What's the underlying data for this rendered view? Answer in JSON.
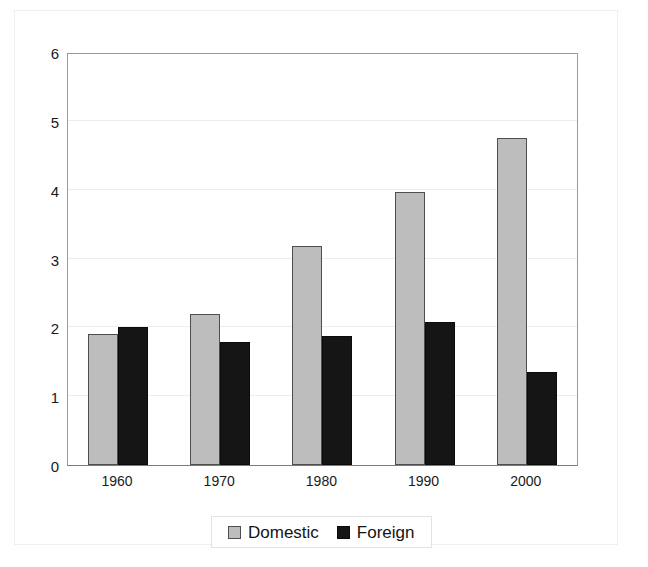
{
  "chart_data": {
    "type": "bar",
    "title": "",
    "subtitle": "",
    "xlabel": "",
    "ylabel": "",
    "categories": [
      "1960",
      "1970",
      "1980",
      "1990",
      "2000"
    ],
    "series": [
      {
        "name": "Domestic",
        "color": "#bdbdbd",
        "values": [
          1.9,
          2.2,
          3.18,
          3.97,
          4.75
        ]
      },
      {
        "name": "Foreign",
        "color": "#151515",
        "values": [
          2.0,
          1.78,
          1.88,
          2.08,
          1.35
        ]
      }
    ],
    "ylim": [
      0,
      6
    ],
    "yticks": [
      0,
      1,
      2,
      3,
      4,
      5,
      6
    ],
    "ytick_labels": [
      "0",
      "1",
      "2",
      "3",
      "4",
      "5",
      "6"
    ],
    "grid": true,
    "grid_axis": "y",
    "legend_position": "bottom-center"
  },
  "legend": {
    "entries": [
      {
        "label": "Domestic",
        "swatch": "gray-square-swatch"
      },
      {
        "label": "Foreign",
        "swatch": "black-square-swatch"
      }
    ]
  }
}
